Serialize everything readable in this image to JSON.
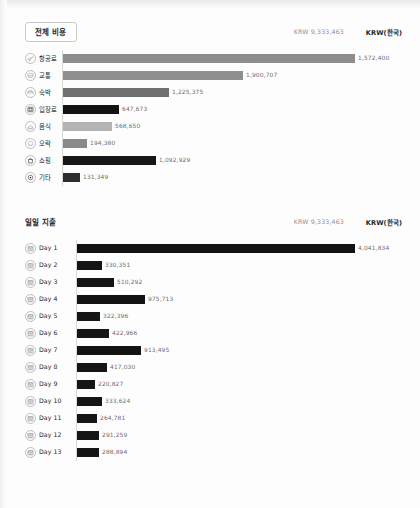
{
  "sections": [
    {
      "id": "overall",
      "title": "전체 비용",
      "title_boxed": true,
      "total": "KRW 9,333,463",
      "currency": "KRW(한국)",
      "axis_left": 62,
      "rows": [
        {
          "label": "항공료",
          "icon": "airplane-icon",
          "value_text": "1,572,400",
          "value": 1572400,
          "width": 292,
          "color": "#8d8d8d"
        },
        {
          "label": "교통",
          "icon": "bus-icon",
          "value_text": "1,900,707",
          "value": 1900707,
          "width": 180,
          "color": "#8f8f8f"
        },
        {
          "label": "숙박",
          "icon": "bed-icon",
          "value_text": "1,225,375",
          "value": 1225375,
          "width": 106,
          "color": "#6f6f6f"
        },
        {
          "label": "입장료",
          "icon": "ticket-icon",
          "value_text": "647,673",
          "value": 647673,
          "width": 56,
          "color": "#131313"
        },
        {
          "label": "음식",
          "icon": "food-icon",
          "value_text": "568,650",
          "value": 568650,
          "width": 49,
          "color": "#b4b4b4"
        },
        {
          "label": "오락",
          "icon": "smile-icon",
          "value_text": "194,380",
          "value": 194380,
          "width": 24,
          "color": "#8a8a8a"
        },
        {
          "label": "쇼핑",
          "icon": "shopping-bag-icon",
          "value_text": "1,092,929",
          "value": 1092929,
          "width": 93,
          "color": "#171717"
        },
        {
          "label": "기타",
          "icon": "pin-icon",
          "value_text": "131,349",
          "value": 131349,
          "width": 17,
          "color": "#2e2e2e"
        }
      ]
    },
    {
      "id": "daily",
      "title": "일일 지출",
      "title_boxed": false,
      "total": "KRW 9,333,463",
      "currency": "KRW(한국)",
      "axis_left": 76,
      "rows": [
        {
          "label": "Day 1",
          "icon": "calendar-icon",
          "value_text": "4,041,834",
          "value": 4041834,
          "width": 278,
          "color": "#121212"
        },
        {
          "label": "Day 2",
          "icon": "calendar-icon",
          "value_text": "330,351",
          "value": 330351,
          "width": 25,
          "color": "#151515"
        },
        {
          "label": "Day 3",
          "icon": "calendar-icon",
          "value_text": "510,292",
          "value": 510292,
          "width": 37,
          "color": "#151515"
        },
        {
          "label": "Day 4",
          "icon": "calendar-icon",
          "value_text": "975,713",
          "value": 975713,
          "width": 68,
          "color": "#131313"
        },
        {
          "label": "Day 5",
          "icon": "calendar-icon",
          "value_text": "322,396",
          "value": 322396,
          "width": 23,
          "color": "#151515"
        },
        {
          "label": "Day 6",
          "icon": "calendar-icon",
          "value_text": "422,966",
          "value": 422966,
          "width": 32,
          "color": "#151515"
        },
        {
          "label": "Day 7",
          "icon": "calendar-icon",
          "value_text": "913,495",
          "value": 913495,
          "width": 64,
          "color": "#131313"
        },
        {
          "label": "Day 8",
          "icon": "calendar-icon",
          "value_text": "417,030",
          "value": 417030,
          "width": 30,
          "color": "#151515"
        },
        {
          "label": "Day 9",
          "icon": "calendar-icon",
          "value_text": "220,827",
          "value": 220827,
          "width": 18,
          "color": "#161616"
        },
        {
          "label": "Day 10",
          "icon": "calendar-icon",
          "value_text": "333,624",
          "value": 333624,
          "width": 25,
          "color": "#151515"
        },
        {
          "label": "Day 11",
          "icon": "calendar-icon",
          "value_text": "264,781",
          "value": 264781,
          "width": 20,
          "color": "#161616"
        },
        {
          "label": "Day 12",
          "icon": "calendar-icon",
          "value_text": "291,259",
          "value": 291259,
          "width": 22,
          "color": "#151515"
        },
        {
          "label": "Day 13",
          "icon": "calendar-icon",
          "value_text": "288,894",
          "value": 288894,
          "width": 22,
          "color": "#151515"
        }
      ]
    }
  ],
  "chart_data": [
    {
      "type": "bar",
      "title": "전체 비용",
      "orientation": "horizontal",
      "xlabel": "",
      "ylabel": "",
      "currency": "KRW(한국)",
      "total": 9333463,
      "total_text": "KRW 9,333,463",
      "categories": [
        "항공료",
        "교통",
        "숙박",
        "입장료",
        "음식",
        "오락",
        "쇼핑",
        "기타"
      ],
      "values": [
        1572400,
        1900707,
        1225375,
        647673,
        568650,
        194380,
        1092929,
        131349
      ],
      "value_labels": [
        "1,572,400",
        "1,900,707",
        "1,225,375",
        "647,673",
        "568,650",
        "194,380",
        "1,092,929",
        "131,349"
      ],
      "grid": false,
      "legend": "none"
    },
    {
      "type": "bar",
      "title": "일일 지출",
      "orientation": "horizontal",
      "xlabel": "",
      "ylabel": "",
      "currency": "KRW(한국)",
      "total": 9333463,
      "total_text": "KRW 9,333,463",
      "categories": [
        "Day 1",
        "Day 2",
        "Day 3",
        "Day 4",
        "Day 5",
        "Day 6",
        "Day 7",
        "Day 8",
        "Day 9",
        "Day 10",
        "Day 11",
        "Day 12",
        "Day 13"
      ],
      "values": [
        4041834,
        330351,
        510292,
        975713,
        322396,
        422966,
        913495,
        417030,
        220827,
        333624,
        264781,
        291259,
        288894
      ],
      "value_labels": [
        "4,041,834",
        "330,351",
        "510,292",
        "975,713",
        "322,396",
        "422,966",
        "913,495",
        "417,030",
        "220,827",
        "333,624",
        "264,781",
        "291,259",
        "288,894"
      ],
      "grid": false,
      "legend": "none"
    }
  ]
}
